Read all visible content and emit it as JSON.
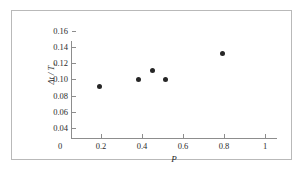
{
  "figure": {
    "axis_color": "#8d8d8d",
    "marker_color": "#262626",
    "frame_color": "#b9b9b9",
    "background": "#ffffff"
  },
  "chart_data": {
    "type": "scatter",
    "title": "",
    "xlabel": "P",
    "ylabel": "Δt / T",
    "ylabel_subscript": "r",
    "xlim": [
      0,
      1
    ],
    "ylim": [
      0.04,
      0.16
    ],
    "grid": false,
    "legend": null,
    "xticks": [
      0,
      0.2,
      0.4,
      0.6,
      0.8,
      1
    ],
    "xtick_labels": [
      "0",
      "0.2",
      "0.4",
      "0.6",
      "0.8",
      "1"
    ],
    "yticks": [
      0.04,
      0.06,
      0.08,
      0.1,
      0.12,
      0.14,
      0.16
    ],
    "ytick_labels": [
      "0.04",
      "0.06",
      "0.08",
      "0.10",
      "0.12",
      "0.14",
      "0.16"
    ],
    "series": [
      {
        "name": "measurements",
        "marker": "filled-circle",
        "points": [
          {
            "x": 0.19,
            "y": 0.092
          },
          {
            "x": 0.385,
            "y": 0.1
          },
          {
            "x": 0.45,
            "y": 0.111
          },
          {
            "x": 0.515,
            "y": 0.1
          },
          {
            "x": 0.79,
            "y": 0.132
          }
        ]
      }
    ]
  }
}
